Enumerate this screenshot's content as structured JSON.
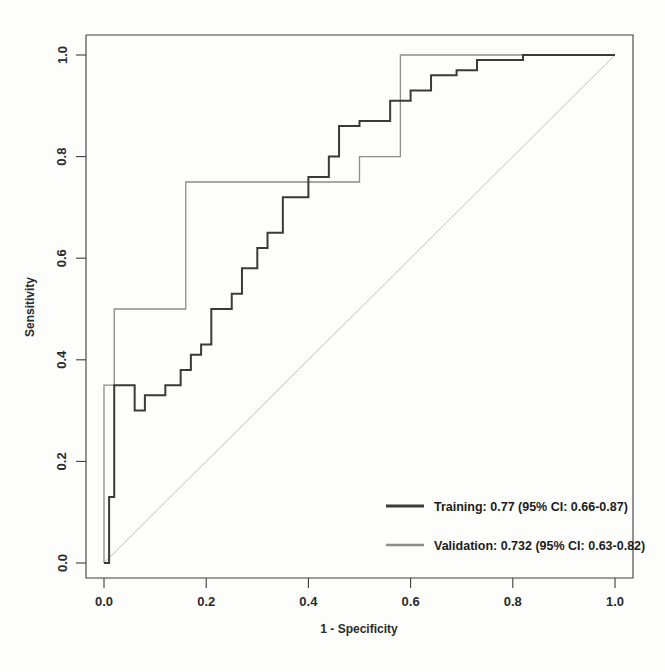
{
  "chart_data": {
    "type": "line",
    "title": "",
    "xlabel": "1 - Specificity",
    "ylabel": "Sensitivity",
    "xlim": [
      0.0,
      1.0
    ],
    "ylim": [
      0.0,
      1.0
    ],
    "grid": false,
    "xticks": [
      "0.0",
      "0.2",
      "0.4",
      "0.6",
      "0.8",
      "1.0"
    ],
    "xtick_values": [
      0.0,
      0.2,
      0.4,
      0.6,
      0.8,
      1.0
    ],
    "yticks": [
      "0.0",
      "0.2",
      "0.4",
      "0.6",
      "0.8",
      "1.0"
    ],
    "ytick_values": [
      0.0,
      0.2,
      0.4,
      0.6,
      0.8,
      1.0
    ],
    "legend_position": "bottom-right",
    "reference_line": {
      "name": "chance-diagonal",
      "x": [
        0.0,
        1.0
      ],
      "y": [
        0.0,
        1.0
      ],
      "color": "#b9b9b9",
      "width": 0.9
    },
    "series": [
      {
        "name": "Training",
        "legend_text": "Training: 0.77 (95% CI: 0.66-0.87)",
        "auc": 0.77,
        "ci_low": 0.66,
        "ci_high": 0.87,
        "color": "#3a3a3a",
        "width": 2.0,
        "x": [
          0.0,
          0.01,
          0.01,
          0.02,
          0.02,
          0.06,
          0.06,
          0.08,
          0.08,
          0.12,
          0.12,
          0.15,
          0.15,
          0.17,
          0.17,
          0.19,
          0.19,
          0.21,
          0.21,
          0.25,
          0.25,
          0.27,
          0.27,
          0.3,
          0.3,
          0.32,
          0.32,
          0.35,
          0.35,
          0.4,
          0.4,
          0.44,
          0.44,
          0.46,
          0.46,
          0.5,
          0.5,
          0.56,
          0.56,
          0.6,
          0.6,
          0.64,
          0.64,
          0.69,
          0.69,
          0.73,
          0.73,
          0.82,
          0.82,
          1.0
        ],
        "y": [
          0.0,
          0.0,
          0.13,
          0.13,
          0.35,
          0.35,
          0.3,
          0.3,
          0.33,
          0.33,
          0.35,
          0.35,
          0.38,
          0.38,
          0.41,
          0.41,
          0.43,
          0.43,
          0.5,
          0.5,
          0.53,
          0.53,
          0.58,
          0.58,
          0.62,
          0.62,
          0.65,
          0.65,
          0.72,
          0.72,
          0.76,
          0.76,
          0.8,
          0.8,
          0.86,
          0.86,
          0.87,
          0.87,
          0.91,
          0.91,
          0.93,
          0.93,
          0.96,
          0.96,
          0.97,
          0.97,
          0.99,
          0.99,
          1.0,
          1.0
        ]
      },
      {
        "name": "Validation",
        "legend_text": "Validation: 0.732 (95% CI: 0.63-0.82)",
        "auc": 0.732,
        "ci_low": 0.63,
        "ci_high": 0.82,
        "color": "#8c8c8c",
        "width": 1.3,
        "x": [
          0.0,
          0.0,
          0.02,
          0.02,
          0.07,
          0.07,
          0.16,
          0.16,
          0.5,
          0.5,
          0.58,
          0.58,
          1.0
        ],
        "y": [
          0.0,
          0.35,
          0.35,
          0.5,
          0.5,
          0.5,
          0.5,
          0.75,
          0.75,
          0.8,
          0.8,
          1.0,
          1.0
        ]
      }
    ]
  },
  "axes": {
    "x_title": "1 - Specificity",
    "y_title": "Sensitivity"
  },
  "legend": {
    "training_label": "Training: 0.77 (95% CI: 0.66-0.87)",
    "validation_label": "Validation: 0.732 (95% CI: 0.63-0.82)"
  }
}
